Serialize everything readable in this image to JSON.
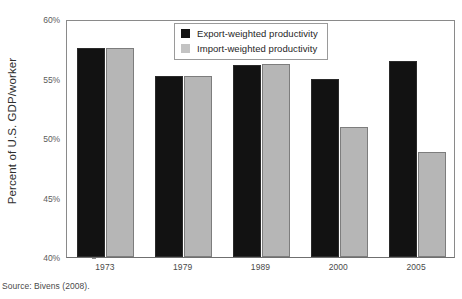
{
  "chart_data": {
    "type": "bar",
    "title": "",
    "xlabel": "",
    "ylabel": "Percent of U.S. GDP/worker",
    "categories": [
      "1973",
      "1979",
      "1989",
      "2000",
      "2005"
    ],
    "series": [
      {
        "name": "Export-weighted productivity",
        "color": "#121212",
        "values": [
          57.6,
          55.2,
          56.1,
          55.0,
          56.5
        ]
      },
      {
        "name": "Import-weighted productivity",
        "color": "#b6b6b6",
        "values": [
          57.6,
          55.2,
          56.2,
          50.9,
          48.8
        ]
      }
    ],
    "ylim": [
      40,
      60
    ],
    "ytick_values": [
      60,
      55,
      50,
      45,
      40
    ],
    "ytick_labels": [
      "60%",
      "55%",
      "50%",
      "45%",
      "40%"
    ],
    "grid": false,
    "legend_position": "top-center"
  },
  "legend": {
    "entries": [
      {
        "label": "Export-weighted productivity",
        "key": "export"
      },
      {
        "label": "Import-weighted productivity",
        "key": "import"
      }
    ]
  },
  "source": {
    "text": "Source: Bivens (2008)."
  }
}
